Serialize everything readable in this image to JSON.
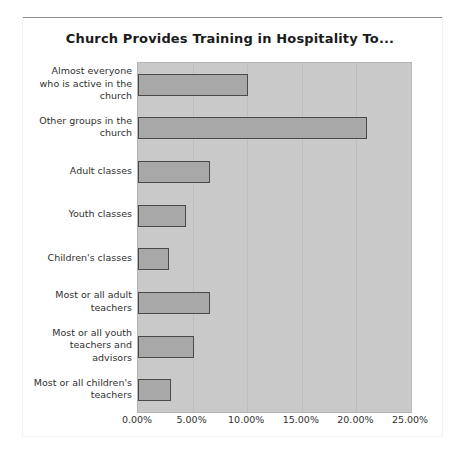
{
  "figure": {
    "title": "Church Provides Training in Hospitality To...",
    "background_color": "#ffffff",
    "plot_background_color": "#c9c9c9",
    "bar_fill_color": "#a8a8a8",
    "bar_border_color": "#4a4a4a",
    "gridline_color": "#bdbdbd"
  },
  "chart_data": {
    "type": "bar",
    "orientation": "horizontal",
    "title": "Church Provides Training in Hospitality To...",
    "xlabel": "",
    "ylabel": "",
    "categories": [
      "Almost everyone who is active in the church",
      "Other groups in the church",
      "Adult classes",
      "Youth classes",
      "Children's classes",
      "Most or all adult teachers",
      "Most or all youth teachers and advisors",
      "Most or all children's teachers"
    ],
    "values": [
      10.1,
      21.0,
      6.6,
      4.4,
      2.8,
      6.6,
      5.1,
      3.0
    ],
    "value_unit": "percent",
    "xlim": [
      0,
      25
    ],
    "xticks": [
      0,
      5,
      10,
      15,
      20,
      25
    ],
    "xticklabels": [
      "0.00%",
      "5.00%",
      "10.00%",
      "15.00%",
      "20.00%",
      "25.00%"
    ],
    "grid": "vertical",
    "legend": null
  },
  "ylabels": [
    [
      "Almost everyone",
      "who is active in the",
      "church"
    ],
    [
      "Other groups in the",
      "church"
    ],
    [
      "Adult classes"
    ],
    [
      "Youth classes"
    ],
    [
      "Children's classes"
    ],
    [
      "Most or all adult",
      "teachers"
    ],
    [
      "Most or all youth",
      "teachers and",
      "advisors"
    ],
    [
      "Most or all children's",
      "teachers"
    ]
  ]
}
